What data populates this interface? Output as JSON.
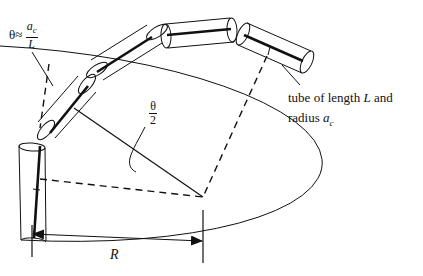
{
  "diagram": {
    "type": "geometry-illustration",
    "labels": {
      "theta_symbol": "θ",
      "theta_approx": "≈",
      "theta_num_base": "a",
      "theta_num_sub": "c",
      "theta_den": "L",
      "half_angle_num": "θ",
      "half_angle_den": "2",
      "tube_line1_pre": "tube of length ",
      "tube_line1_L": "L",
      "tube_line1_post": " and",
      "tube_line2_pre": "radius ",
      "tube_line2_a": "a",
      "tube_line2_sub": "c",
      "radius_label": "R"
    },
    "tube_count": 5,
    "colors": {
      "stroke": "#111111",
      "background": "#ffffff"
    }
  }
}
